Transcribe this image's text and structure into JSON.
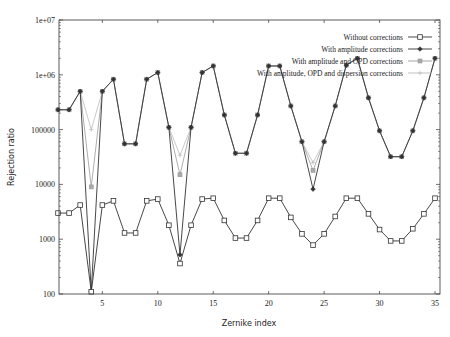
{
  "chart_data": {
    "type": "line",
    "title": "",
    "xlabel": "Zernike index",
    "ylabel": "Rejection ratio",
    "xlim": [
      1,
      35
    ],
    "ylim": [
      100,
      10000000
    ],
    "yscale": "log",
    "x_ticks": [
      5,
      10,
      15,
      20,
      25,
      30,
      35
    ],
    "y_ticks": [
      100,
      1000,
      10000,
      100000,
      1000000,
      10000000
    ],
    "y_tick_labels": [
      "100",
      "1000",
      "10000",
      "100000",
      "1e+06",
      "1e+07"
    ],
    "grid": false,
    "legend_position": "top-right inside",
    "x": [
      1,
      2,
      3,
      4,
      5,
      6,
      7,
      8,
      9,
      10,
      11,
      12,
      13,
      14,
      15,
      16,
      17,
      18,
      19,
      20,
      21,
      22,
      23,
      24,
      25,
      26,
      27,
      28,
      29,
      30,
      31,
      32,
      33,
      34,
      35
    ],
    "series": [
      {
        "name": "Without corrections",
        "marker": "square",
        "color": "#333333",
        "values": [
          3000,
          3000,
          4200,
          110,
          4200,
          5000,
          1300,
          1300,
          5000,
          5400,
          1800,
          360,
          1800,
          5400,
          5600,
          2200,
          1050,
          1050,
          2200,
          5600,
          5600,
          2500,
          1250,
          780,
          1250,
          2600,
          5600,
          5600,
          2900,
          1500,
          930,
          930,
          1550,
          2900,
          5600
        ]
      },
      {
        "name": "With amplitude corrections",
        "marker": "diamond",
        "color": "#333333",
        "values": [
          230000,
          230000,
          500000,
          110,
          500000,
          830000,
          55000,
          55000,
          830000,
          1100000,
          110000,
          520,
          110000,
          1100000,
          1450000,
          185000,
          37000,
          37000,
          185000,
          1450000,
          1450000,
          270000,
          60000,
          8200,
          60000,
          270000,
          1500000,
          2000000,
          380000,
          95000,
          32000,
          32000,
          95000,
          380000,
          2000000
        ]
      },
      {
        "name": "With amplitude and OPD corrections",
        "marker": "x-square",
        "color": "#999999",
        "values": [
          230000,
          230000,
          500000,
          9000,
          500000,
          830000,
          55000,
          55000,
          830000,
          1100000,
          110000,
          15000,
          110000,
          1100000,
          1450000,
          185000,
          37000,
          37000,
          185000,
          1450000,
          1450000,
          270000,
          60000,
          18000,
          60000,
          270000,
          1500000,
          2000000,
          380000,
          95000,
          32000,
          32000,
          95000,
          380000,
          2000000
        ]
      },
      {
        "name": "With amplitude, OPD and dispersion corrections",
        "marker": "plus",
        "color": "#bbbbbb",
        "values": [
          230000,
          230000,
          500000,
          100000,
          500000,
          830000,
          55000,
          55000,
          830000,
          1100000,
          110000,
          34000,
          110000,
          1100000,
          1450000,
          185000,
          37000,
          37000,
          185000,
          1450000,
          1450000,
          270000,
          60000,
          25000,
          60000,
          270000,
          1500000,
          2000000,
          380000,
          95000,
          32000,
          32000,
          95000,
          380000,
          2000000
        ]
      }
    ]
  }
}
